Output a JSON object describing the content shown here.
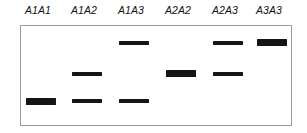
{
  "figure": {
    "type": "gel-electrophoresis",
    "width": 307,
    "height": 133,
    "background_color": "#ffffff",
    "band_color": "#151515",
    "gel_border_color": "#9a9a9a"
  },
  "gel": {
    "left": 20,
    "top": 25,
    "width": 272,
    "height": 101,
    "band_rows": [
      {
        "id": "row-top",
        "y": 43
      },
      {
        "id": "row-middle",
        "y": 74
      },
      {
        "id": "row-bottom",
        "y": 101
      }
    ]
  },
  "lanes": [
    {
      "label": "A1A1",
      "label_left": 22,
      "label_width": 32,
      "band_left": 26,
      "band_width": 30,
      "bands": [
        {
          "row": "row-bottom",
          "y": 98,
          "height": 7,
          "weight": "thick"
        }
      ]
    },
    {
      "label": "A1A2",
      "label_left": 68,
      "label_width": 32,
      "band_left": 72,
      "band_width": 30,
      "bands": [
        {
          "row": "row-middle",
          "y": 72,
          "height": 4,
          "weight": "thin"
        },
        {
          "row": "row-bottom",
          "y": 99,
          "height": 4,
          "weight": "thin"
        }
      ]
    },
    {
      "label": "A1A3",
      "label_left": 115,
      "label_width": 32,
      "band_left": 119,
      "band_width": 30,
      "bands": [
        {
          "row": "row-top",
          "y": 41,
          "height": 4,
          "weight": "thin"
        },
        {
          "row": "row-bottom",
          "y": 99,
          "height": 4,
          "weight": "thin"
        }
      ]
    },
    {
      "label": "A2A2",
      "label_left": 162,
      "label_width": 32,
      "band_left": 166,
      "band_width": 30,
      "bands": [
        {
          "row": "row-middle",
          "y": 70,
          "height": 7,
          "weight": "thick"
        }
      ]
    },
    {
      "label": "A2A3",
      "label_left": 209,
      "label_width": 32,
      "band_left": 213,
      "band_width": 30,
      "bands": [
        {
          "row": "row-top",
          "y": 41,
          "height": 4,
          "weight": "thin"
        },
        {
          "row": "row-middle",
          "y": 72,
          "height": 4,
          "weight": "thin"
        }
      ]
    },
    {
      "label": "A3A3",
      "label_left": 253,
      "label_width": 32,
      "band_left": 257,
      "band_width": 30,
      "bands": [
        {
          "row": "row-top",
          "y": 39,
          "height": 7,
          "weight": "thick"
        }
      ]
    }
  ]
}
